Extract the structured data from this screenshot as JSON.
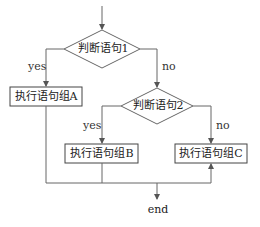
{
  "diagram": {
    "type": "flowchart",
    "nodes": {
      "decision1": {
        "label": "判断语句1",
        "shape": "diamond"
      },
      "decision2": {
        "label": "判断语句2",
        "shape": "diamond"
      },
      "blockA": {
        "label": "执行语句组A",
        "shape": "rect"
      },
      "blockB": {
        "label": "执行语句组B",
        "shape": "rect"
      },
      "blockC": {
        "label": "执行语句组C",
        "shape": "rect"
      },
      "end": {
        "label": "end",
        "shape": "terminal-text"
      }
    },
    "edges": {
      "d1_yes": {
        "label": "yes",
        "from": "decision1",
        "to": "blockA"
      },
      "d1_no": {
        "label": "no",
        "from": "decision1",
        "to": "decision2"
      },
      "d2_yes": {
        "label": "yes",
        "from": "decision2",
        "to": "blockB"
      },
      "d2_no": {
        "label": "no",
        "from": "decision2",
        "to": "blockC"
      }
    },
    "colors": {
      "line": "#555555",
      "background": "#ffffff",
      "text": "#222222"
    }
  }
}
